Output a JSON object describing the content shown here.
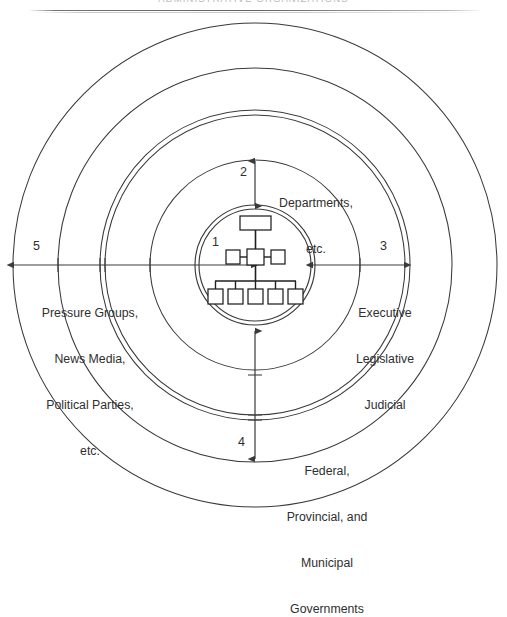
{
  "header": {
    "title": "ADMINISTRATIVE ORGANIZATIONS"
  },
  "diagram": {
    "type": "concentric-rings",
    "center_label": "1",
    "org_chart": {
      "top_boxes": 1,
      "middle_boxes": 3,
      "bottom_boxes": 5
    },
    "rings": [
      {
        "number": "1",
        "label": "",
        "position": "center",
        "description": "organization chart core"
      },
      {
        "number": "2",
        "label": "Departments,\netc.",
        "line1": "Departments,",
        "line2": "etc.",
        "position": "top"
      },
      {
        "number": "3",
        "label": "Executive\nLegislative\nJudicial",
        "line1": "Executive",
        "line2": "Legislative",
        "line3": "Judicial",
        "position": "right"
      },
      {
        "number": "4",
        "label": "Federal,\nProvincial, and\nMunicipal\nGovernments",
        "line1": "Federal,",
        "line2": "Provincial, and",
        "line3": "Municipal",
        "line4": "Governments",
        "position": "bottom"
      },
      {
        "number": "5",
        "label": "Pressure Groups,\nNews Media,\nPolitical Parties,\netc.",
        "line1": "Pressure Groups,",
        "line2": "News Media,",
        "line3": "Political Parties,",
        "line4": "etc.",
        "position": "left"
      }
    ]
  },
  "colors": {
    "line": "#3a3a3a",
    "text": "#2f2f2f",
    "header_text": "#b9b9bd",
    "background": "#ffffff"
  }
}
